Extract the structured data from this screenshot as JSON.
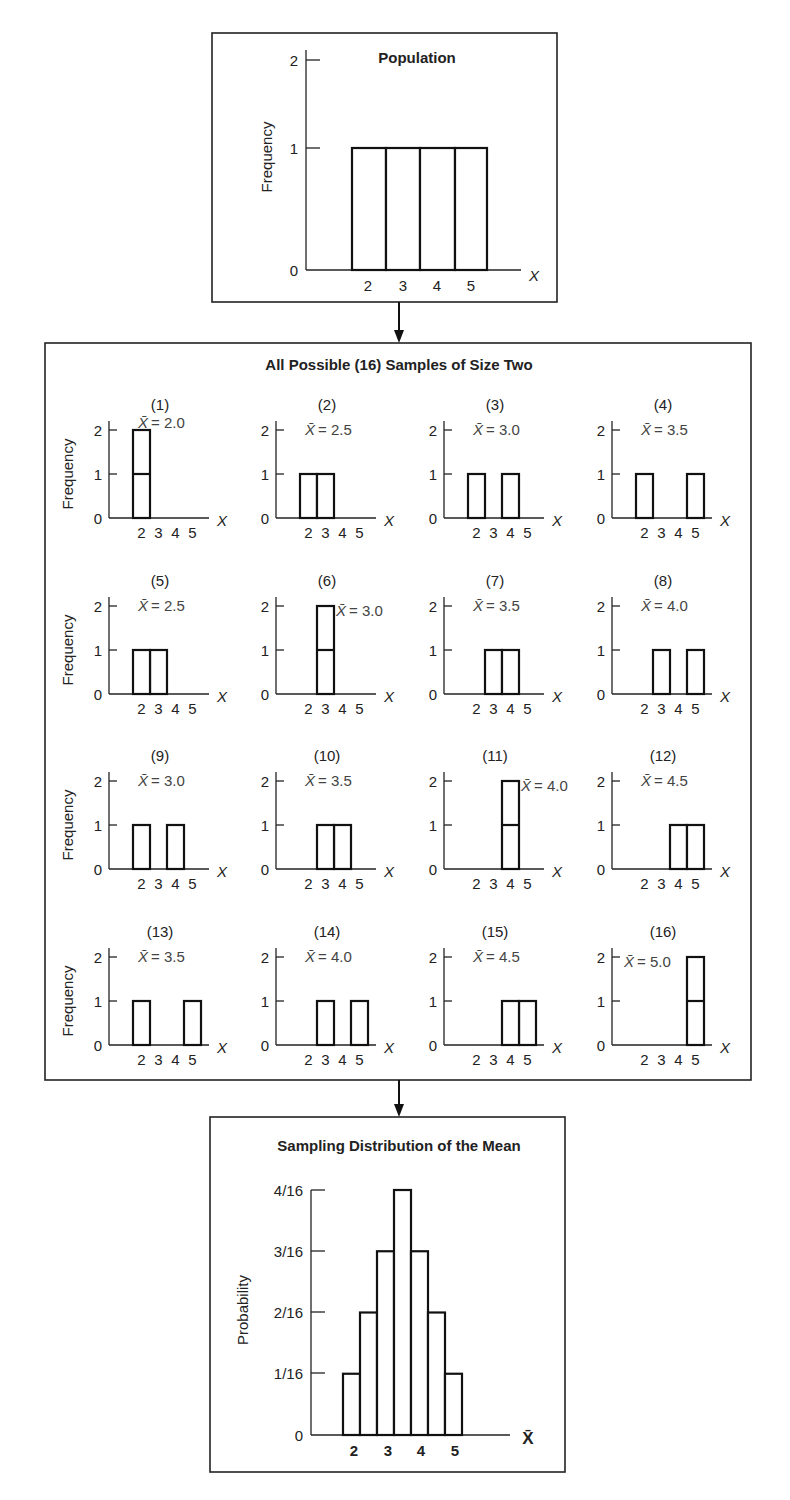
{
  "population": {
    "title": "Population",
    "ylabel": "Frequency",
    "xlabel": "X",
    "yticks": [
      "0",
      "1",
      "2"
    ],
    "xticks": [
      "2",
      "3",
      "4",
      "5"
    ]
  },
  "samples": {
    "title": "All Possible (16) Samples of Size Two",
    "ylabel": "Frequency",
    "xlabel": "X",
    "yticks": [
      "0",
      "1",
      "2"
    ],
    "xticks": [
      "2",
      "3",
      "4",
      "5"
    ],
    "mean_symbol": "X̄",
    "items": [
      {
        "label": "(1)",
        "mean": "= 2.0",
        "pair": [
          2,
          2
        ]
      },
      {
        "label": "(2)",
        "mean": "= 2.5",
        "pair": [
          2,
          3
        ]
      },
      {
        "label": "(3)",
        "mean": "= 3.0",
        "pair": [
          2,
          4
        ]
      },
      {
        "label": "(4)",
        "mean": "= 3.5",
        "pair": [
          2,
          5
        ]
      },
      {
        "label": "(5)",
        "mean": "= 2.5",
        "pair": [
          3,
          2
        ]
      },
      {
        "label": "(6)",
        "mean": "= 3.0",
        "pair": [
          3,
          3
        ]
      },
      {
        "label": "(7)",
        "mean": "= 3.5",
        "pair": [
          3,
          4
        ]
      },
      {
        "label": "(8)",
        "mean": "= 4.0",
        "pair": [
          3,
          5
        ]
      },
      {
        "label": "(9)",
        "mean": "= 3.0",
        "pair": [
          4,
          2
        ]
      },
      {
        "label": "(10)",
        "mean": "= 3.5",
        "pair": [
          4,
          3
        ]
      },
      {
        "label": "(11)",
        "mean": "= 4.0",
        "pair": [
          4,
          4
        ]
      },
      {
        "label": "(12)",
        "mean": "= 4.5",
        "pair": [
          4,
          5
        ]
      },
      {
        "label": "(13)",
        "mean": "= 3.5",
        "pair": [
          5,
          2
        ]
      },
      {
        "label": "(14)",
        "mean": "= 4.0",
        "pair": [
          5,
          3
        ]
      },
      {
        "label": "(15)",
        "mean": "= 4.5",
        "pair": [
          5,
          4
        ]
      },
      {
        "label": "(16)",
        "mean": "= 5.0",
        "pair": [
          5,
          5
        ]
      }
    ]
  },
  "sampling": {
    "title": "Sampling Distribution of the Mean",
    "ylabel": "Probability",
    "xlabel": "X̄",
    "yticks": [
      "0",
      "1/16",
      "2/16",
      "3/16",
      "4/16"
    ],
    "xticks": [
      "2",
      "3",
      "4",
      "5"
    ]
  },
  "chart_data": [
    {
      "type": "bar",
      "title": "Population",
      "xlabel": "X",
      "ylabel": "Frequency",
      "categories": [
        2,
        3,
        4,
        5
      ],
      "values": [
        1,
        1,
        1,
        1
      ],
      "ylim": [
        0,
        2
      ]
    },
    {
      "type": "bar",
      "title": "All Possible (16) Samples of Size Two",
      "xlabel": "X",
      "ylabel": "Frequency",
      "categories": [
        2,
        3,
        4,
        5
      ],
      "ylim": [
        0,
        2
      ],
      "series": [
        {
          "name": "(1) X̄ = 2.0",
          "values": [
            2,
            0,
            0,
            0
          ]
        },
        {
          "name": "(2) X̄ = 2.5",
          "values": [
            1,
            1,
            0,
            0
          ]
        },
        {
          "name": "(3) X̄ = 3.0",
          "values": [
            1,
            0,
            1,
            0
          ]
        },
        {
          "name": "(4) X̄ = 3.5",
          "values": [
            1,
            0,
            0,
            1
          ]
        },
        {
          "name": "(5) X̄ = 2.5",
          "values": [
            1,
            1,
            0,
            0
          ]
        },
        {
          "name": "(6) X̄ = 3.0",
          "values": [
            0,
            2,
            0,
            0
          ]
        },
        {
          "name": "(7) X̄ = 3.5",
          "values": [
            0,
            1,
            1,
            0
          ]
        },
        {
          "name": "(8) X̄ = 4.0",
          "values": [
            0,
            1,
            0,
            1
          ]
        },
        {
          "name": "(9) X̄ = 3.0",
          "values": [
            1,
            0,
            1,
            0
          ]
        },
        {
          "name": "(10) X̄ = 3.5",
          "values": [
            0,
            1,
            1,
            0
          ]
        },
        {
          "name": "(11) X̄ = 4.0",
          "values": [
            0,
            0,
            2,
            0
          ]
        },
        {
          "name": "(12) X̄ = 4.5",
          "values": [
            0,
            0,
            1,
            1
          ]
        },
        {
          "name": "(13) X̄ = 3.5",
          "values": [
            1,
            0,
            0,
            1
          ]
        },
        {
          "name": "(14) X̄ = 4.0",
          "values": [
            0,
            1,
            0,
            1
          ]
        },
        {
          "name": "(15) X̄ = 4.5",
          "values": [
            0,
            0,
            1,
            1
          ]
        },
        {
          "name": "(16) X̄ = 5.0",
          "values": [
            0,
            0,
            0,
            2
          ]
        }
      ]
    },
    {
      "type": "bar",
      "title": "Sampling Distribution of the Mean",
      "xlabel": "X̄",
      "ylabel": "Probability",
      "categories": [
        2.0,
        2.5,
        3.0,
        3.5,
        4.0,
        4.5,
        5.0
      ],
      "values": [
        0.0625,
        0.125,
        0.1875,
        0.25,
        0.1875,
        0.125,
        0.0625
      ],
      "value_labels": [
        "1/16",
        "2/16",
        "3/16",
        "4/16",
        "3/16",
        "2/16",
        "1/16"
      ],
      "ylim": [
        0,
        0.25
      ]
    }
  ]
}
